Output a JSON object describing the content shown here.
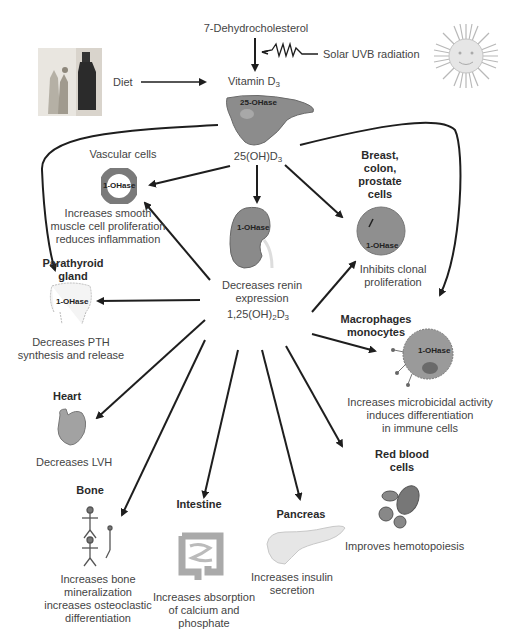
{
  "diagram": {
    "source": {
      "precursor": "7-Dehydrocholesterol",
      "uvb": "Solar UVB radiation",
      "diet": "Diet",
      "vitamin_d3": "Vitamin D",
      "vitamin_d3_sub": "3",
      "liver_enzyme": "25-OHase",
      "calcidiol_prefix": "25(OH)D",
      "calcidiol_sub": "3",
      "kidney_enzyme": "1-OHase",
      "kidney_effect_line1": "Decreases renin",
      "kidney_effect_line2": "expression",
      "calcitriol_prefix": "1,25(OH)",
      "calcitriol_sub1": "2",
      "calcitriol_mid": "D",
      "calcitriol_sub2": "3"
    },
    "targets": {
      "vascular": {
        "title": "Vascular cells",
        "enzyme": "1-OHase",
        "effect": [
          "Increases smooth",
          "muscle cell proliferation",
          "reduces inflammation"
        ]
      },
      "breast": {
        "title": [
          "Breast,",
          "colon,",
          "prostate",
          "cells"
        ],
        "enzyme": "1-OHase",
        "effect": [
          "Inhibits clonal",
          "proliferation"
        ]
      },
      "parathyroid": {
        "title": [
          "Parathyroid",
          "gland"
        ],
        "enzyme": "1-OHase",
        "effect": [
          "Decreases PTH",
          "synthesis and release"
        ]
      },
      "macrophages": {
        "title": [
          "Macrophages",
          "monocytes"
        ],
        "enzyme": "1-OHase",
        "effect": [
          "Increases microbicidal activity",
          "induces differentiation",
          "in immune cells"
        ]
      },
      "heart": {
        "title": "Heart",
        "effect": [
          "Decreases LVH"
        ]
      },
      "red_blood": {
        "title": [
          "Red blood",
          "cells"
        ],
        "effect": [
          "Improves hemotopoiesis"
        ]
      },
      "bone": {
        "title": "Bone",
        "effect": [
          "Increases bone",
          "mineralization",
          "increases osteoclastic",
          "differentiation"
        ]
      },
      "intestine": {
        "title": "Intestine",
        "effect": [
          "Increases absorption",
          "of calcium and",
          "phosphate"
        ]
      },
      "pancreas": {
        "title": "Pancreas",
        "effect": [
          "Increases insulin",
          "secretion"
        ]
      }
    },
    "colors": {
      "arrow": "#1e1e1e",
      "text": "#444444",
      "organ_gray": "#8a8a8a"
    }
  }
}
